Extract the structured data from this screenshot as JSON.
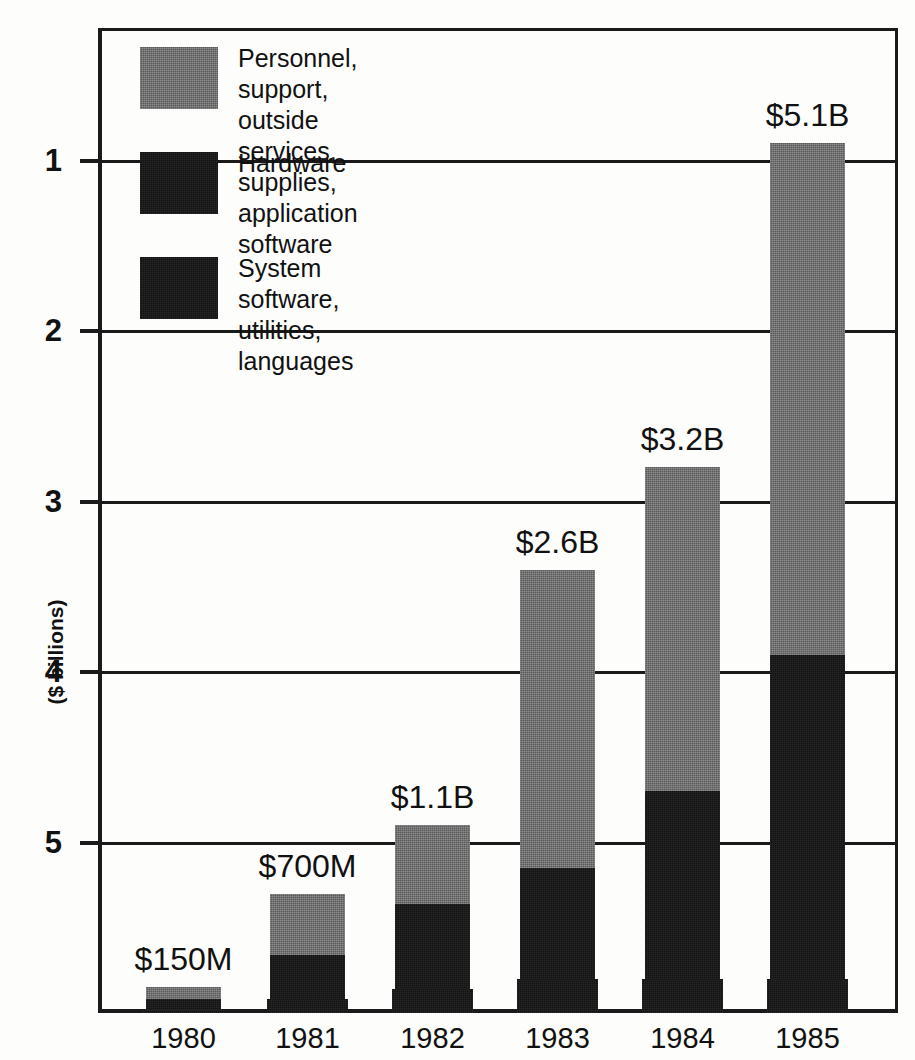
{
  "title_sliver": "expenditures",
  "axis": {
    "y_title": "($ billions)",
    "y_ticks": [
      "5",
      "4",
      "3",
      "2",
      "1"
    ]
  },
  "legend": {
    "items": [
      {
        "label": "Personnel, support, outside services,\nsupplies, application software",
        "swatch": "gray-swatch",
        "color": "#5a5a5a"
      },
      {
        "label": "Hardware",
        "swatch": "black-swatch",
        "color": "#131313"
      },
      {
        "label": "System software, utilities,\nlanguages",
        "swatch": "black-swatch",
        "color": "#131313"
      }
    ]
  },
  "bars": [
    {
      "year": "1980",
      "total_label": "$150M"
    },
    {
      "year": "1981",
      "total_label": "$700M"
    },
    {
      "year": "1982",
      "total_label": "$1.1B"
    },
    {
      "year": "1983",
      "total_label": "$2.6B"
    },
    {
      "year": "1984",
      "total_label": "$3.2B"
    },
    {
      "year": "1985",
      "total_label": "$5.1B"
    }
  ],
  "chart_data": {
    "type": "bar",
    "subtype": "stacked-vertical",
    "title": "expenditures",
    "xlabel": "",
    "ylabel": "($ billions)",
    "ylim": [
      0,
      5.8
    ],
    "ytick_values": [
      1,
      2,
      3,
      4,
      5
    ],
    "grid": "horizontal",
    "legend_position": "inside-top-left",
    "categories": [
      "1980",
      "1981",
      "1982",
      "1983",
      "1984",
      "1985"
    ],
    "totals": [
      0.15,
      0.7,
      1.1,
      2.6,
      3.2,
      5.1
    ],
    "total_labels": [
      "$150M",
      "$700M",
      "$1.1B",
      "$2.6B",
      "$3.2B",
      "$5.1B"
    ],
    "series": [
      {
        "name": "Personnel, support, outside services, supplies, application software",
        "color": "#5a5a5a",
        "values": [
          0.07,
          0.36,
          0.46,
          1.75,
          1.9,
          3.0
        ]
      },
      {
        "name": "Hardware",
        "color": "#131313",
        "values": [
          0.06,
          0.26,
          0.5,
          0.65,
          1.1,
          1.9
        ]
      },
      {
        "name": "System software, utilities, languages",
        "color": "#131313",
        "values": [
          0.02,
          0.08,
          0.14,
          0.2,
          0.2,
          0.2
        ]
      }
    ]
  }
}
